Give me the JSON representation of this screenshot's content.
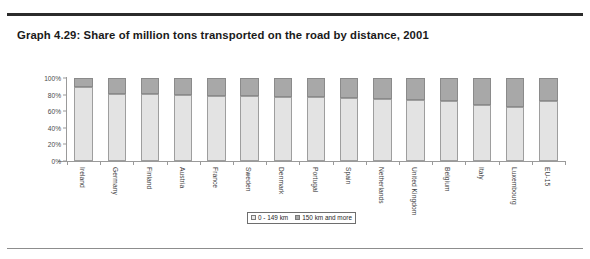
{
  "caption": "Graph 4.29: Share of million tons transported on the road by distance, 2001",
  "legend": {
    "low_label": "0 - 149 km",
    "high_label": "150 km and more"
  },
  "colors": {
    "low": "#e3e3e3",
    "high": "#a8a8a8",
    "axis": "#9a9a9a",
    "rule_top": "#2b2b2b",
    "rule_bottom": "#8d8d8d",
    "text": "#1a1a1a"
  },
  "chart_data": {
    "type": "bar",
    "title": "Graph 4.29: Share of million tons transported on the road by distance, 2001",
    "xlabel": "",
    "ylabel": "",
    "stacked": true,
    "grid": false,
    "legend_position": "bottom",
    "ylim": [
      0,
      100
    ],
    "yticks": [
      "0%",
      "20%",
      "40%",
      "60%",
      "80%",
      "100%"
    ],
    "ytick_values": [
      0,
      20,
      40,
      60,
      80,
      100
    ],
    "categories": [
      "Ireland",
      "Germany",
      "Finland",
      "Austria",
      "France",
      "Sweden",
      "Denmark",
      "Portugal",
      "Spain",
      "Netherlands",
      "United Kingdom",
      "Belgium",
      "Italy",
      "Luxembourg",
      "EU-15"
    ],
    "series": [
      {
        "name": "0 - 149 km",
        "values": [
          89,
          81,
          81,
          79,
          78,
          78,
          77,
          77,
          76,
          75,
          73,
          72,
          67,
          65,
          72
        ]
      },
      {
        "name": "150 km and more",
        "values": [
          11,
          19,
          19,
          21,
          22,
          22,
          23,
          23,
          24,
          25,
          27,
          28,
          33,
          35,
          28
        ]
      }
    ]
  }
}
